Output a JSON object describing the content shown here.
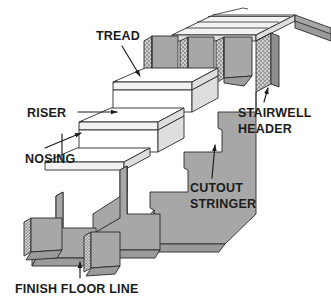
{
  "figure": {
    "type": "technical-line-diagram",
    "background_color": "#ffffff",
    "line_color": "#1b1b1b",
    "fill_gray": "#a7a7a7",
    "fill_white": "#ffffff"
  },
  "labels": {
    "tread": "TREAD",
    "riser": "RISER",
    "nosing": "NOSING",
    "stairwell_header_line1": "STAIRWELL",
    "stairwell_header_line2": "HEADER",
    "cutout_stringer_line1": "CUTOUT",
    "cutout_stringer_line2": "STRINGER",
    "finish_floor_line": "FINISH FLOOR LINE"
  },
  "parts": {
    "tread": "tread",
    "riser": "riser",
    "nosing": "nosing",
    "stairwell_header": "stairwell-header",
    "cutout_stringer": "cutout-stringer",
    "floor_joist": "floor-joist",
    "upper_floor_deck": "upper-floor-deck",
    "finish_floor_line": "finish-floor-line"
  }
}
